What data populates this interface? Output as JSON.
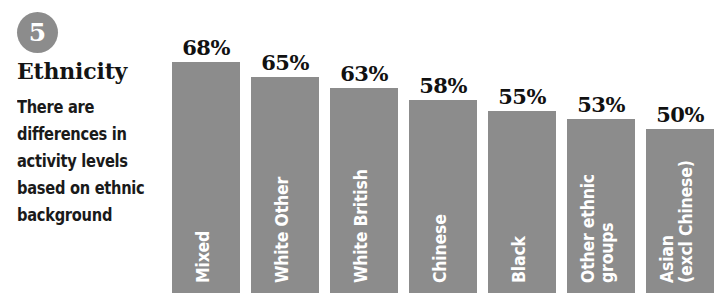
{
  "panel": {
    "badge_number": "5",
    "heading": "Ethnicity",
    "blurb": "There are differences in activity levels based on ethnic background"
  },
  "colors": {
    "bar_fill": "#8c8c8c",
    "badge_fill": "#8c8c8c",
    "value_text": "#111111",
    "bar_label_text": "#ffffff",
    "background": "#ffffff"
  },
  "chart_data": {
    "type": "bar",
    "title": "Ethnicity",
    "subtitle": "There are differences in activity levels based on ethnic background",
    "xlabel": "",
    "ylabel": "",
    "ylim": [
      0,
      75
    ],
    "grid": false,
    "legend": "none",
    "value_suffix": "%",
    "categories": [
      "Mixed",
      "White Other",
      "White British",
      "Chinese",
      "Black",
      "Other ethnic groups",
      "Asian (excl Chinese)"
    ],
    "values": [
      68,
      65,
      63,
      58,
      55,
      53,
      50
    ],
    "value_labels": [
      "68%",
      "65%",
      "63%",
      "58%",
      "55%",
      "53%",
      "50%"
    ],
    "bars": [
      {
        "label": "Mixed",
        "label_lines": [
          "Mixed"
        ],
        "value": 68,
        "value_label": "68%",
        "x": 4,
        "width": 68,
        "top": 62
      },
      {
        "label": "White Other",
        "label_lines": [
          "White Other"
        ],
        "value": 65,
        "value_label": "65%",
        "x": 83,
        "width": 68,
        "top": 77
      },
      {
        "label": "White British",
        "label_lines": [
          "White British"
        ],
        "value": 63,
        "value_label": "63%",
        "x": 162,
        "width": 68,
        "top": 88
      },
      {
        "label": "Chinese",
        "label_lines": [
          "Chinese"
        ],
        "value": 58,
        "value_label": "58%",
        "x": 241,
        "width": 68,
        "top": 100
      },
      {
        "label": "Black",
        "label_lines": [
          "Black"
        ],
        "value": 55,
        "value_label": "55%",
        "x": 320,
        "width": 68,
        "top": 111
      },
      {
        "label": "Other ethnic groups",
        "label_lines": [
          "Other ethnic",
          "groups"
        ],
        "value": 53,
        "value_label": "53%",
        "x": 399,
        "width": 68,
        "top": 119
      },
      {
        "label": "Asian (excl Chinese)",
        "label_lines": [
          "Asian",
          "(excl Chinese)"
        ],
        "value": 50,
        "value_label": "50%",
        "x": 478,
        "width": 68,
        "top": 129
      }
    ]
  }
}
